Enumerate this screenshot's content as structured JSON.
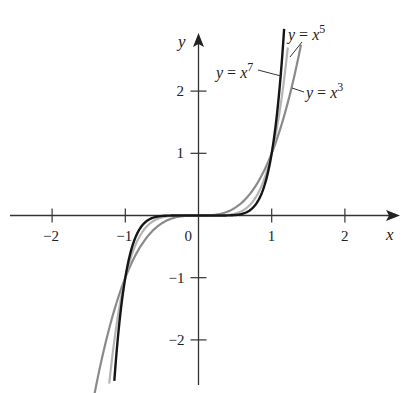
{
  "chart_data": {
    "type": "line",
    "title": "",
    "xlabel": "x",
    "ylabel": "y",
    "xlim": [
      -2.6,
      2.7
    ],
    "ylim": [
      -2.7,
      2.9
    ],
    "grid": false,
    "legend": "inline labels",
    "x_ticks": [
      -2,
      -1,
      0,
      1,
      2
    ],
    "x_tick_labels": [
      "−2",
      "−1",
      "0",
      "1",
      "2"
    ],
    "y_ticks": [
      -2,
      -1,
      1,
      2
    ],
    "y_tick_labels": [
      "−2",
      "−1",
      "1",
      "2"
    ],
    "series": [
      {
        "name": "y = x^3",
        "label_base": "y = x",
        "exponent": "3",
        "power": 3,
        "domain": [
          -1.42,
          1.4
        ],
        "color": "#8a8a8a",
        "points": [
          [
            -1.4,
            -2.744
          ],
          [
            -1,
            -1
          ],
          [
            -0.5,
            -0.125
          ],
          [
            0,
            0
          ],
          [
            0.5,
            0.125
          ],
          [
            1,
            1
          ],
          [
            1.4,
            2.744
          ]
        ]
      },
      {
        "name": "y = x^5",
        "label_base": "y = x",
        "exponent": "5",
        "power": 5,
        "domain": [
          -1.22,
          1.22
        ],
        "color": "#b4b4b4",
        "points": [
          [
            -1.22,
            -2.7
          ],
          [
            -1,
            -1
          ],
          [
            -0.5,
            -0.031
          ],
          [
            0,
            0
          ],
          [
            0.5,
            0.031
          ],
          [
            1,
            1
          ],
          [
            1.22,
            2.7
          ]
        ]
      },
      {
        "name": "y = x^7",
        "label_base": "y = x",
        "exponent": "7",
        "power": 7,
        "domain": [
          -1.15,
          1.17
        ],
        "color": "#151515",
        "points": [
          [
            -1.15,
            -2.66
          ],
          [
            -1,
            -1
          ],
          [
            -0.5,
            -0.008
          ],
          [
            0,
            0
          ],
          [
            0.5,
            0.008
          ],
          [
            1,
            1
          ],
          [
            1.15,
            2.66
          ]
        ]
      }
    ],
    "annotations": [
      "y = x^7",
      "y = x^5",
      "y = x^3"
    ]
  }
}
